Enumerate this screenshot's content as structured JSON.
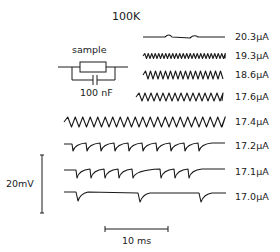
{
  "chart_data": {
    "type": "line",
    "title": "100K",
    "circuit": {
      "element_label": "sample",
      "capacitor_label": "100 nF"
    },
    "series": [
      {
        "name": "20.3μA",
        "shape": "low-amplitude noisy",
        "y_center": 37
      },
      {
        "name": "19.3μA",
        "shape": "small fast oscillation",
        "y_center": 56
      },
      {
        "name": "18.6μA",
        "shape": "sinusoidal oscillation",
        "y_center": 75
      },
      {
        "name": "17.6μA",
        "shape": "sinusoidal oscillation",
        "y_center": 97
      },
      {
        "name": "17.4μA",
        "shape": "sawtooth oscillation",
        "y_center": 122
      },
      {
        "name": "17.2μA",
        "shape": "relaxation spikes",
        "y_center": 146
      },
      {
        "name": "17.1μA",
        "shape": "intermittent relaxation spikes",
        "y_center": 172
      },
      {
        "name": "17.0μA",
        "shape": "sparse relaxation spikes",
        "y_center": 197
      }
    ],
    "scale_bars": {
      "vertical": "20mV",
      "horizontal": "10 ms"
    }
  },
  "title": "100K",
  "circuit": {
    "sample_label": "sample",
    "cap_label": "100 nF"
  },
  "labels": [
    "20.3μA",
    "19.3μA",
    "18.6μA",
    "17.6μA",
    "17.4μA",
    "17.2μA",
    "17.1μA",
    "17.0μA"
  ],
  "scale": {
    "v": "20mV",
    "t": "10 ms"
  }
}
